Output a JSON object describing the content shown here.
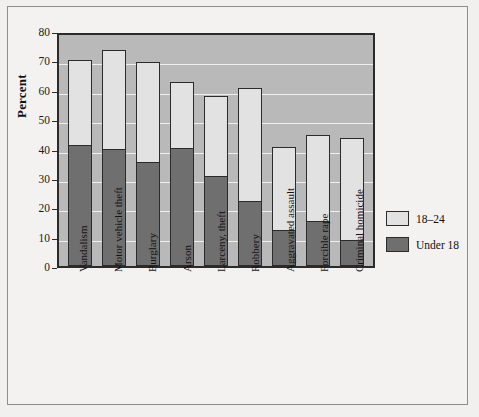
{
  "chart_data": {
    "type": "bar",
    "subtype": "stacked",
    "title": "",
    "xlabel": "",
    "ylabel": "Percent",
    "ylim": [
      0,
      80
    ],
    "ytick_step": 10,
    "yticks": [
      0,
      10,
      20,
      30,
      40,
      50,
      60,
      70,
      80
    ],
    "grid": true,
    "grid_axis": "y",
    "legend_position": "right",
    "categories": [
      "Vandalism",
      "Motor vehicle theft",
      "Burglary",
      "Arson",
      "Larceny, theft",
      "Robbery",
      "Aggravated assault",
      "Forcible rape",
      "Criminal homicide"
    ],
    "series": [
      {
        "name": "Under 18",
        "color": "#6f6f6f",
        "values": [
          41.5,
          40.0,
          35.5,
          40.5,
          31.0,
          22.5,
          12.5,
          15.5,
          9.0
        ]
      },
      {
        "name": "18–24",
        "color": "#e2e2e2",
        "values": [
          28.5,
          33.5,
          34.0,
          22.0,
          27.0,
          38.0,
          28.0,
          29.0,
          34.5
        ]
      }
    ],
    "totals": [
      70.0,
      73.5,
      69.5,
      62.5,
      58.0,
      60.5,
      40.5,
      44.5,
      43.5
    ]
  },
  "legend": {
    "entries": [
      {
        "label": "18–24",
        "swatch": "#e2e2e2"
      },
      {
        "label": "Under 18",
        "swatch": "#6f6f6f"
      }
    ]
  },
  "colors": {
    "plot_background": "#b9b9b9",
    "figure_background": "#f3f2f0",
    "bar_upper": "#e2e2e2",
    "bar_lower": "#6f6f6f",
    "axis": "#2b2b2b",
    "gridline": "#f0f0f0"
  }
}
